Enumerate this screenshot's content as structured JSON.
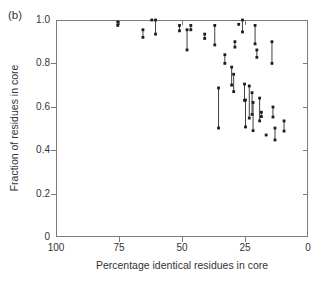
{
  "figure": {
    "panel_label": "(b)",
    "background": "#ffffff"
  },
  "colors": {
    "frame": "#7a7a7a",
    "tick": "#7a7a7a",
    "text": "#333333",
    "point": "#1c1c1c",
    "segment_line": "#2a2a2a"
  },
  "chart_data": {
    "type": "scatter",
    "title": "",
    "panel_label": "(b)",
    "xlabel": "Percentage identical residues in core",
    "ylabel": "Fraction of residues in core",
    "xlim": [
      100,
      0
    ],
    "x_axis_reversed": true,
    "ylim": [
      0,
      1.0
    ],
    "grid": false,
    "legend": null,
    "marker": "small-filled-square",
    "x_ticks": [
      {
        "value": 100,
        "label": "100"
      },
      {
        "value": 75,
        "label": "75"
      },
      {
        "value": 50,
        "label": "50"
      },
      {
        "value": 25,
        "label": "25"
      },
      {
        "value": 0,
        "label": "0"
      }
    ],
    "y_ticks": [
      {
        "value": 0,
        "label": "0"
      },
      {
        "value": 0.2,
        "label": "0.2"
      },
      {
        "value": 0.4,
        "label": "0.4"
      },
      {
        "value": 0.6,
        "label": "0.6"
      },
      {
        "value": 0.8,
        "label": "0.8"
      },
      {
        "value": 1.0,
        "label": "1.0"
      }
    ],
    "segments": [
      {
        "x": 75.5,
        "y_low": 0.975,
        "y_high": 0.99
      },
      {
        "x": 65.5,
        "y_low": 0.92,
        "y_high": 0.955
      },
      {
        "x": 62.0,
        "y_low": 1.0,
        "y_high": 1.0
      },
      {
        "x": 60.5,
        "y_low": 0.935,
        "y_high": 1.0
      },
      {
        "x": 51.0,
        "y_low": 0.95,
        "y_high": 0.975
      },
      {
        "x": 48.0,
        "y_low": 0.862,
        "y_high": 0.955
      },
      {
        "x": 46.5,
        "y_low": 0.955,
        "y_high": 0.975
      },
      {
        "x": 41.0,
        "y_low": 0.915,
        "y_high": 0.935
      },
      {
        "x": 37.0,
        "y_low": 0.885,
        "y_high": 0.975
      },
      {
        "x": 33.0,
        "y_low": 0.8,
        "y_high": 0.84
      },
      {
        "x": 29.0,
        "y_low": 0.875,
        "y_high": 0.9
      },
      {
        "x": 27.5,
        "y_low": 0.98,
        "y_high": 0.98
      },
      {
        "x": 26.0,
        "y_low": 0.945,
        "y_high": 1.0
      },
      {
        "x": 21.0,
        "y_low": 0.89,
        "y_high": 0.975
      },
      {
        "x": 20.3,
        "y_low": 0.828,
        "y_high": 0.862
      },
      {
        "x": 14.3,
        "y_low": 0.8,
        "y_high": 0.9
      },
      {
        "x": 35.5,
        "y_low": 0.502,
        "y_high": 0.687
      },
      {
        "x": 30.3,
        "y_low": 0.7,
        "y_high": 0.783
      },
      {
        "x": 29.5,
        "y_low": 0.67,
        "y_high": 0.75
      },
      {
        "x": 25.2,
        "y_low": 0.63,
        "y_high": 0.705
      },
      {
        "x": 24.8,
        "y_low": 0.507,
        "y_high": 0.631
      },
      {
        "x": 23.3,
        "y_low": 0.548,
        "y_high": 0.696
      },
      {
        "x": 22.2,
        "y_low": 0.565,
        "y_high": 0.665
      },
      {
        "x": 21.8,
        "y_low": 0.49,
        "y_high": 0.62
      },
      {
        "x": 19.2,
        "y_low": 0.535,
        "y_high": 0.64
      },
      {
        "x": 18.5,
        "y_low": 0.555,
        "y_high": 0.575
      },
      {
        "x": 16.6,
        "y_low": 0.47,
        "y_high": 0.47
      },
      {
        "x": 13.9,
        "y_low": 0.553,
        "y_high": 0.599
      },
      {
        "x": 13.1,
        "y_low": 0.447,
        "y_high": 0.502
      },
      {
        "x": 9.5,
        "y_low": 0.488,
        "y_high": 0.535
      }
    ]
  }
}
